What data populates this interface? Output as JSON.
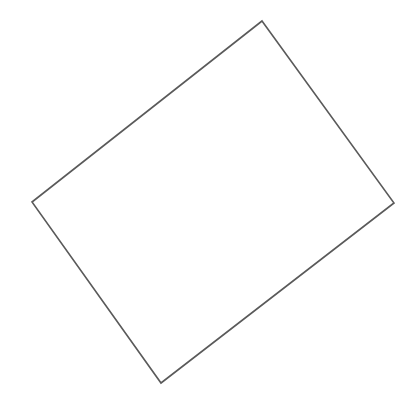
{
  "canvas": {
    "width": 413,
    "height": 405,
    "background": "#ffffff"
  },
  "shapes": [
    {
      "type": "quadrilateral",
      "description": "rotated rectangle outline",
      "stroke": "#5a5a5a",
      "stroke_width": 1.6,
      "fill": "none",
      "vertices": [
        {
          "name": "top",
          "x": 262,
          "y": 21
        },
        {
          "name": "right",
          "x": 394,
          "y": 203
        },
        {
          "name": "bottom",
          "x": 161,
          "y": 383
        },
        {
          "name": "left",
          "x": 32,
          "y": 202
        }
      ]
    }
  ]
}
